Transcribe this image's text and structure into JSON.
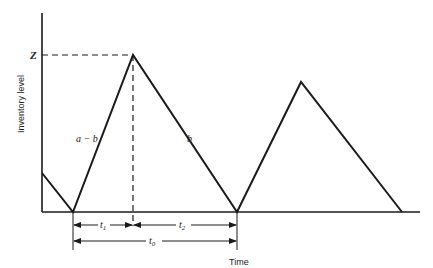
{
  "diagram": {
    "axes": {
      "y_label": "Inventory level",
      "x_label": "Time",
      "y_tick_label": "Z"
    },
    "segment_labels": {
      "rising_rate": "a − b",
      "falling_rate": "b"
    },
    "dimension_labels": {
      "t1": "t",
      "t1_sub": "1",
      "t2": "t",
      "t2_sub": "2",
      "t0": "t",
      "t0_sub": "0"
    },
    "colors": {
      "line": "#1a1a1a",
      "background": "#ffffff"
    }
  }
}
